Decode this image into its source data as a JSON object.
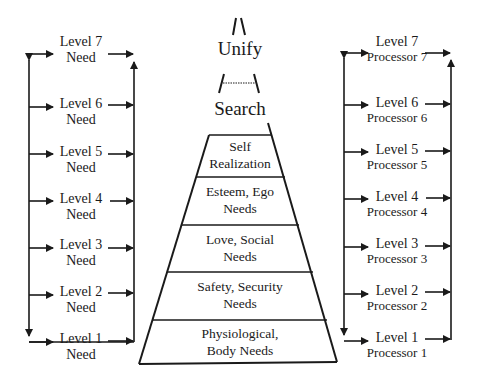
{
  "diagram": {
    "type": "hierarchy-pyramid",
    "top_labels": {
      "unify": "Unify",
      "search": "Search"
    },
    "pyramid_layers": [
      {
        "line1": "Self",
        "line2": "Realization"
      },
      {
        "line1": "Esteem, Ego",
        "line2": "Needs"
      },
      {
        "line1": "Love, Social",
        "line2": "Needs"
      },
      {
        "line1": "Safety, Security",
        "line2": "Needs"
      },
      {
        "line1": "Physiological,",
        "line2": "Body Needs"
      }
    ],
    "left_column": [
      {
        "line1": "Level 7",
        "line2": "Need"
      },
      {
        "line1": "Level 6",
        "line2": "Need"
      },
      {
        "line1": "Level 5",
        "line2": "Need"
      },
      {
        "line1": "Level 4",
        "line2": "Need"
      },
      {
        "line1": "Level 3",
        "line2": "Need"
      },
      {
        "line1": "Level 2",
        "line2": "Need"
      },
      {
        "line1": "Level 1",
        "line2": "Need"
      }
    ],
    "right_column": [
      {
        "line1": "Level 7",
        "line2": "Processor 7"
      },
      {
        "line1": "Level 6",
        "line2": "Processor 6"
      },
      {
        "line1": "Level 5",
        "line2": "Processor 5"
      },
      {
        "line1": "Level 4",
        "line2": "Processor 4"
      },
      {
        "line1": "Level 3",
        "line2": "Processor 3"
      },
      {
        "line1": "Level 2",
        "line2": "Processor 2"
      },
      {
        "line1": "Level 1",
        "line2": "Processor 1"
      }
    ],
    "colors": {
      "line": "#1a1a1a",
      "background": "#ffffff"
    }
  }
}
